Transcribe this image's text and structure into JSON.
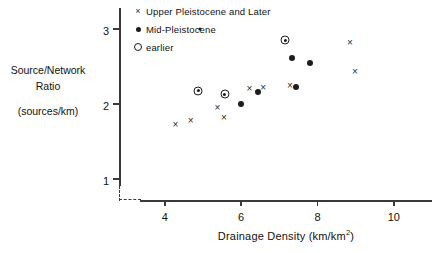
{
  "chart_data": {
    "type": "scatter",
    "title": "",
    "xlabel": "Drainage Density  (km/km²)",
    "ylabel_lines": [
      "Source/Network",
      "Ratio",
      "(sources/km)"
    ],
    "xlim": [
      2.8,
      11.0
    ],
    "ylim": [
      0.72,
      3.28
    ],
    "xticks": [
      4,
      6,
      8,
      10
    ],
    "yticks": [
      1,
      2,
      3
    ],
    "xtick_labels": [
      "4",
      "6",
      "8",
      "10"
    ],
    "ytick_labels": [
      "1",
      "2",
      "3"
    ],
    "grid": false,
    "axis_break": true,
    "legend_position": "top-left-inside",
    "series": [
      {
        "name": "Upper Pleistocene and Later",
        "marker": "cross",
        "marker_glyph": "×",
        "color": "#2b2b2b",
        "points": [
          {
            "x": 4.28,
            "y": 1.72
          },
          {
            "x": 4.68,
            "y": 1.78
          },
          {
            "x": 5.38,
            "y": 1.95
          },
          {
            "x": 5.55,
            "y": 1.82
          },
          {
            "x": 6.22,
            "y": 2.2
          },
          {
            "x": 6.58,
            "y": 2.21
          },
          {
            "x": 7.28,
            "y": 2.24
          },
          {
            "x": 8.85,
            "y": 2.82
          },
          {
            "x": 8.98,
            "y": 2.43
          }
        ]
      },
      {
        "name": "Mid-Pleistocene",
        "marker": "dot",
        "marker_glyph": "●",
        "color": "#1c1c1c",
        "points": [
          {
            "x": 6.0,
            "y": 2.0
          },
          {
            "x": 6.45,
            "y": 2.16
          },
          {
            "x": 7.33,
            "y": 2.62
          },
          {
            "x": 7.45,
            "y": 2.23
          },
          {
            "x": 7.8,
            "y": 2.55
          }
        ]
      },
      {
        "name": "earlier",
        "marker": "circle-dot",
        "marker_glyph": "◎",
        "color": "#1c1c1c",
        "points": [
          {
            "x": 4.88,
            "y": 2.18
          },
          {
            "x": 5.57,
            "y": 2.13
          },
          {
            "x": 7.15,
            "y": 2.85
          }
        ]
      }
    ]
  }
}
